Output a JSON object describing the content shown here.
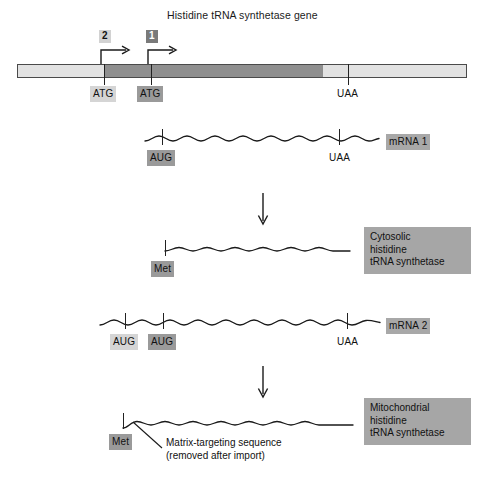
{
  "figure": {
    "title": "Histidine tRNA synthetase gene",
    "background": "#ffffff"
  },
  "colors": {
    "bar_outline": "#4a4a4a",
    "bar_light": "#e2e2e2",
    "bar_dark": "#8f8f8f",
    "tag_light": "#d2d2d2",
    "tag_dark": "#7a7a7a",
    "label_gray": "#a8a8a8",
    "box_gray": "#a6a6a6",
    "line": "#1a1a1a"
  },
  "gene": {
    "start_sites": [
      {
        "id": "site2",
        "label": "2",
        "style": "light"
      },
      {
        "id": "site1",
        "label": "1",
        "style": "dark"
      }
    ],
    "codons": [
      {
        "id": "gene-atg-2",
        "label": "ATG",
        "style": "light"
      },
      {
        "id": "gene-atg-1",
        "label": "ATG",
        "style": "dark"
      },
      {
        "id": "gene-uaa",
        "label": "UAA",
        "style": "none"
      }
    ]
  },
  "mrna1": {
    "label": "mRNA 1",
    "codons": [
      {
        "id": "mrna1-aug",
        "label": "AUG",
        "style": "dark"
      },
      {
        "id": "mrna1-uaa",
        "label": "UAA",
        "style": "none"
      }
    ]
  },
  "protein1": {
    "start_label": "Met",
    "start_style": "dark",
    "box_lines": [
      "Cytosolic",
      "histidine",
      "tRNA synthetase"
    ]
  },
  "mrna2": {
    "label": "mRNA 2",
    "codons": [
      {
        "id": "mrna2-aug-upstream",
        "label": "AUG",
        "style": "light"
      },
      {
        "id": "mrna2-aug-downstream",
        "label": "AUG",
        "style": "dark"
      },
      {
        "id": "mrna2-uaa",
        "label": "UAA",
        "style": "none"
      }
    ]
  },
  "protein2": {
    "start_label": "Met",
    "start_style": "dark",
    "box_lines": [
      "Mitochondrial",
      "histidine",
      "tRNA synthetase"
    ],
    "annotation_lines": [
      "Matrix-targeting sequence",
      "(removed after import)"
    ]
  },
  "arrows": {
    "translation_1": "downward-arrow",
    "translation_2": "downward-arrow"
  }
}
